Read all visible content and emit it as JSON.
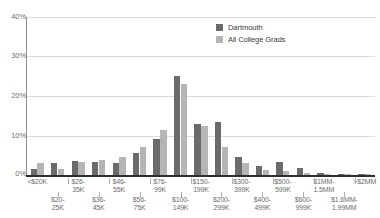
{
  "legend": {
    "position": "top-right",
    "entries": [
      {
        "label": "Dartmouth",
        "color": "#6b6b6b",
        "swatch": "legend-swatch-dark"
      },
      {
        "label": "All College Grads",
        "color": "#b5b5b5",
        "swatch": "legend-swatch-light"
      }
    ]
  },
  "axes": {
    "y_ticks": [
      "0%",
      "10%",
      "20%",
      "30%",
      "40%"
    ],
    "y_min": 0,
    "y_max": 40
  },
  "chart_data": {
    "type": "bar",
    "title": "",
    "subtitle": "",
    "xlabel": "",
    "ylabel": "",
    "ylim": [
      0,
      40
    ],
    "ytick_values": [
      0,
      10,
      20,
      30,
      40
    ],
    "ytick_labels": [
      "0%",
      "10%",
      "20%",
      "30%",
      "40%"
    ],
    "grid": true,
    "grid_axis": "y",
    "legend_position": "top-right",
    "categories": [
      "<$20K",
      "$20-25K",
      "$26-35K",
      "$36-45K",
      "$46-55K",
      "$56-75K",
      "$76-99K",
      "$100-149K",
      "$150-199K",
      "$200-299K",
      "$300-399K",
      "$400-499K",
      "$500-599K",
      "$600-999K",
      "$1MM-1.5MM",
      "$1.6MM-1.99MM",
      ">$2MM"
    ],
    "categories_display": [
      "<$20K",
      "$20-\n25K",
      "$26-\n35K",
      "$36-\n45K",
      "$46-\n55K",
      "$56-\n75K",
      "$76-\n99K",
      "$100-\n149K",
      "$150-\n199K",
      "$200-\n299K",
      "$300-\n399K",
      "$400-\n499K",
      "$500-\n599K",
      "$600-\n999K",
      "$1MM-\n1.5MM",
      "$1.6MM-\n1.99MM",
      ">$2MM"
    ],
    "series": [
      {
        "name": "Dartmouth",
        "color": "#6b6b6b",
        "values": [
          1.6,
          3.0,
          3.6,
          3.2,
          3.0,
          5.5,
          9.2,
          25.0,
          13.0,
          13.5,
          4.5,
          2.2,
          3.2,
          1.8,
          0.5,
          0.2,
          0.2
        ]
      },
      {
        "name": "All College Grads",
        "color": "#b5b5b5",
        "values": [
          3.0,
          1.4,
          3.4,
          3.9,
          4.6,
          7.2,
          11.5,
          23.0,
          12.5,
          7.0,
          3.0,
          1.3,
          1.0,
          0.5,
          0.2,
          0.1,
          0.1
        ]
      }
    ]
  }
}
